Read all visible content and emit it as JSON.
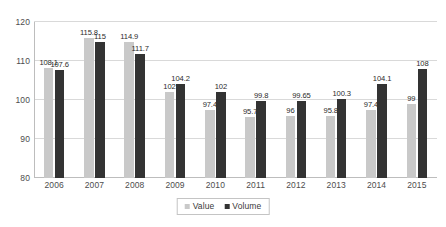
{
  "chart_data": {
    "type": "bar",
    "title": "",
    "subtitle": "",
    "xlabel": "",
    "ylabel": "",
    "categories": [
      "2006",
      "2007",
      "2008",
      "2009",
      "2010",
      "2011",
      "2012",
      "2013",
      "2014",
      "2015"
    ],
    "series": [
      {
        "name": "Value",
        "color": "#c9c9c9",
        "values": [
          108.1,
          115.8,
          114.9,
          102,
          97.4,
          95.7,
          96,
          95.8,
          97.4,
          99
        ],
        "labels": [
          "108.1",
          "115.8",
          "114.9",
          "102",
          "97.4",
          "95.7",
          "96",
          "95.8",
          "97.4",
          "99"
        ]
      },
      {
        "name": "Volume",
        "color": "#333333",
        "values": [
          107.6,
          115,
          111.7,
          104.2,
          102,
          99.8,
          99.65,
          100.3,
          104.1,
          108
        ],
        "labels": [
          "107.6",
          "115",
          "111.7",
          "104.2",
          "102",
          "99.8",
          "99.65",
          "100.3",
          "104.1",
          "108"
        ]
      }
    ],
    "ylim": [
      80,
      120
    ],
    "yticks": [
      80,
      90,
      100,
      110,
      120
    ],
    "yticklabels": [
      "80",
      "90",
      "100",
      "110",
      "120"
    ],
    "grid": true,
    "legend_position": "bottom-center"
  },
  "legend": {
    "items": [
      {
        "label": "Value",
        "swatch": "value-swatch"
      },
      {
        "label": "Volume",
        "swatch": "volume-swatch"
      }
    ]
  }
}
